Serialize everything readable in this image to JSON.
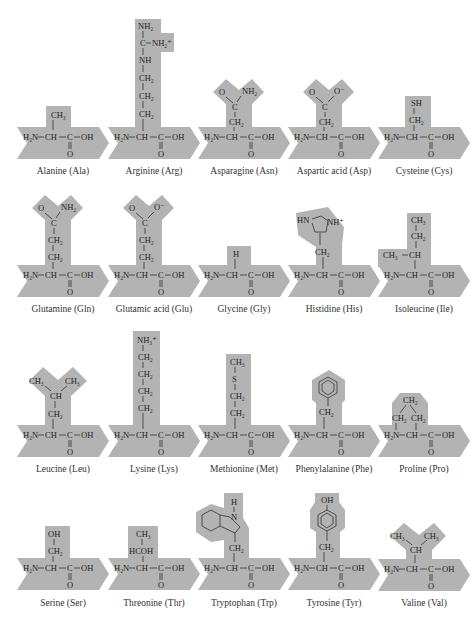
{
  "figure": {
    "backbone": {
      "amine": "H₂N",
      "alpha": "CH",
      "carboxyl_c": "C",
      "hydroxyl": "OH",
      "carbonyl_o": "O"
    },
    "colors": {
      "shade": "#b3b3b3",
      "ink": "#1e1e1e",
      "background": "#ffffff"
    },
    "amino_acids": [
      {
        "name": "Alanine (Ala)",
        "side_chain": [
          "CH₃"
        ]
      },
      {
        "name": "Arginine (Arg)",
        "side_chain": [
          "NH₂",
          "C",
          "NH₂⁺",
          "NH",
          "CH₂",
          "CH₂",
          "CH₂"
        ]
      },
      {
        "name": "Asparagine (Asn)",
        "side_chain": [
          "O",
          "NH₂",
          "C",
          "CH₂"
        ]
      },
      {
        "name": "Aspartic acid (Asp)",
        "side_chain": [
          "O",
          "O⁻",
          "C",
          "CH₂"
        ]
      },
      {
        "name": "Cysteine (Cys)",
        "side_chain": [
          "SH",
          "CH₂"
        ]
      },
      {
        "name": "Glutamine (Gln)",
        "side_chain": [
          "O",
          "NH₂",
          "C",
          "CH₂",
          "CH₂"
        ]
      },
      {
        "name": "Glutamic acid (Glu)",
        "side_chain": [
          "O",
          "O⁻",
          "C",
          "CH₂",
          "CH₂"
        ]
      },
      {
        "name": "Glycine (Gly)",
        "side_chain": [
          "H"
        ]
      },
      {
        "name": "Histidine (His)",
        "side_chain": [
          "HN",
          "NH⁺",
          "CH₂"
        ]
      },
      {
        "name": "Isoleucine (Ile)",
        "side_chain": [
          "CH₃",
          "CH₂",
          "CH₃",
          "CH"
        ]
      },
      {
        "name": "Leucine (Leu)",
        "side_chain": [
          "CH₃",
          "CH₃",
          "CH",
          "CH₂"
        ]
      },
      {
        "name": "Lysine (Lys)",
        "side_chain": [
          "NH₃⁺",
          "CH₂",
          "CH₂",
          "CH₂",
          "CH₂"
        ]
      },
      {
        "name": "Methionine (Met)",
        "side_chain": [
          "CH₃",
          "S",
          "CH₂",
          "CH₂"
        ]
      },
      {
        "name": "Phenylalanine (Phe)",
        "side_chain": [
          "CH₂"
        ]
      },
      {
        "name": "Proline (Pro)",
        "side_chain": [
          "CH₂",
          "CH₂",
          "CH₂"
        ]
      },
      {
        "name": "Serine (Ser)",
        "side_chain": [
          "OH",
          "CH₂"
        ]
      },
      {
        "name": "Threonine (Thr)",
        "side_chain": [
          "CH₃",
          "HCOH"
        ]
      },
      {
        "name": "Tryptophan (Trp)",
        "side_chain": [
          "H",
          "N",
          "CH₂"
        ]
      },
      {
        "name": "Tyrosine (Tyr)",
        "side_chain": [
          "OH",
          "CH₂"
        ]
      },
      {
        "name": "Valine (Val)",
        "side_chain": [
          "CH₃",
          "CH₃",
          "CH"
        ]
      }
    ]
  }
}
